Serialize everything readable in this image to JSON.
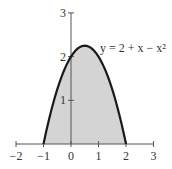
{
  "chart_data": {
    "type": "area",
    "title": "",
    "equation_label": "y = 2 + x − x²",
    "function": "2 + x - x^2",
    "shaded_region": {
      "from_x": -1,
      "to_x": 2,
      "between": "curve and x-axis"
    },
    "x": [
      -1,
      -0.5,
      0,
      0.5,
      1,
      1.5,
      2
    ],
    "series": [
      {
        "name": "y = 2 + x − x²",
        "values": [
          0,
          1.25,
          2,
          2.25,
          2,
          1.25,
          0
        ]
      }
    ],
    "xlabel": "",
    "ylabel": "",
    "xlim": [
      -2,
      3
    ],
    "ylim": [
      0,
      3
    ],
    "x_ticks": [
      "−2",
      "−1",
      "0",
      "1",
      "2",
      "3"
    ],
    "y_ticks": [
      "1",
      "2",
      "3"
    ],
    "grid": false,
    "legend": "none",
    "colors": {
      "fill": "#d4d4d4",
      "curve": "#1a1a1a",
      "axis": "#555555"
    }
  }
}
